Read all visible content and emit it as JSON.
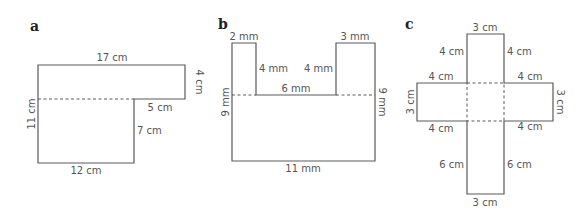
{
  "figures": [
    {
      "id": "a",
      "panel_label": "a",
      "description": "L-shaped composite figure split by a dashed line",
      "labels": {
        "top": "17 cm",
        "right": "4 cm",
        "step": "5 cm",
        "inner_right": "7 cm",
        "bottom": "12 cm",
        "left": "11 cm"
      }
    },
    {
      "id": "b",
      "panel_label": "b",
      "description": "U-shaped composite figure split by a dashed line",
      "labels": {
        "left_tab_top": "2 mm",
        "right_tab_top": "3 mm",
        "left_tab_inner": "4 mm",
        "right_tab_inner": "4 mm",
        "gap": "6 mm",
        "left": "9 mm",
        "right": "9 mm",
        "bottom": "11 mm"
      }
    },
    {
      "id": "c",
      "panel_label": "c",
      "description": "Cross-shaped composite figure with dashed central square",
      "labels": {
        "top": "3 cm",
        "top_arm_left": "4 cm",
        "top_arm_right": "4 cm",
        "left_arm_top": "4 cm",
        "right_arm_top": "4 cm",
        "left_arm_end": "3 cm",
        "right_arm_end": "3 cm",
        "left_arm_bottom": "4 cm",
        "right_arm_bottom": "4 cm",
        "bottom_arm_left": "6 cm",
        "bottom_arm_right": "6 cm",
        "bottom": "3 cm"
      }
    }
  ]
}
